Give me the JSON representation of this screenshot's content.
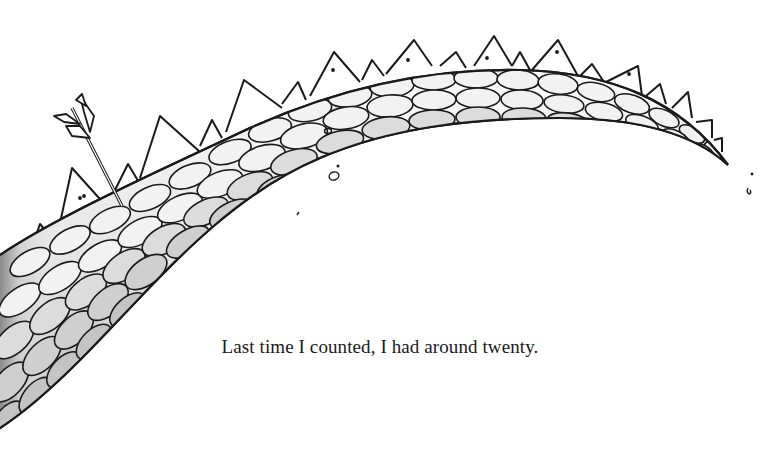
{
  "page": {
    "caption": "Last time I counted, I had around twenty.",
    "illustration": {
      "subject": "dragon-tail",
      "details": [
        "scales",
        "spikes",
        "arrow-stuck-in-tail"
      ],
      "colors": {
        "ink": "#1a1a1a",
        "scale_light": "#f4f4f4",
        "scale_shade": "#bdbdbd",
        "background": "#ffffff"
      }
    }
  }
}
